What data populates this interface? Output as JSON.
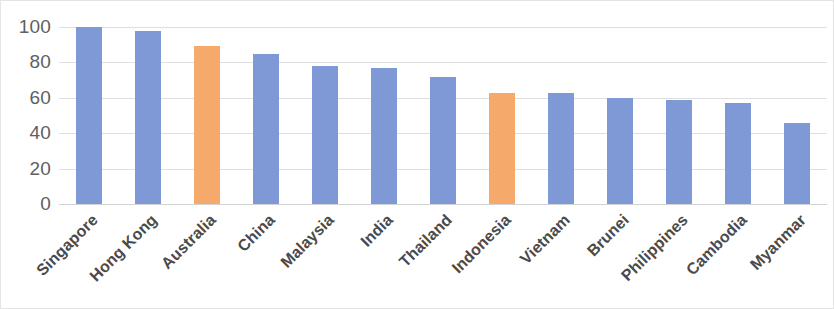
{
  "chart_data": {
    "type": "bar",
    "title": "",
    "subtitle": "",
    "xlabel": "",
    "ylabel": "",
    "ylim": [
      0,
      100
    ],
    "ytick_labels": [
      "100",
      "80",
      "60",
      "40",
      "20",
      "0"
    ],
    "yticks": [
      100,
      80,
      60,
      40,
      20,
      0
    ],
    "grid": true,
    "legend": "none",
    "categories": [
      "Singapore",
      "Hong Kong",
      "Australia",
      "China",
      "Malaysia",
      "India",
      "Thailand",
      "Indonesia",
      "Vietnam",
      "Brunei",
      "Philippines",
      "Cambodia",
      "Myanmar"
    ],
    "values": [
      100,
      98,
      89,
      85,
      78,
      77,
      72,
      63,
      63,
      60,
      59,
      57,
      46
    ],
    "point_colors": [
      "#7f98d6",
      "#7f98d6",
      "#f5aa6c",
      "#7f98d6",
      "#7f98d6",
      "#7f98d6",
      "#7f98d6",
      "#f5aa6c",
      "#7f98d6",
      "#7f98d6",
      "#7f98d6",
      "#7f98d6",
      "#7f98d6"
    ],
    "colors": {
      "bar_primary": "#7f98d6",
      "bar_highlight": "#f5aa6c",
      "gridline": "#dfdfdf",
      "axis_text": "#606060",
      "category_text": "#4a4a4a",
      "background": "#ffffff"
    }
  }
}
